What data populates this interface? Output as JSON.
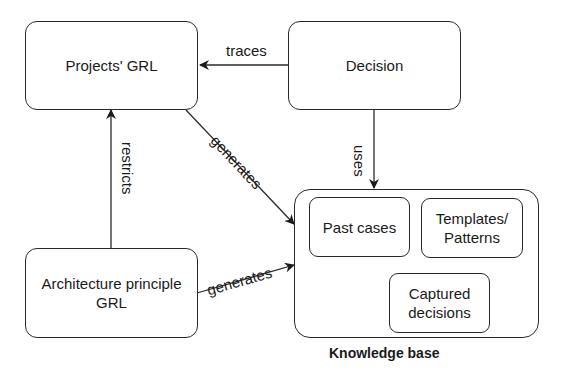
{
  "diagram": {
    "nodes": {
      "projects_grl": "Projects' GRL",
      "decision": "Decision",
      "architecture_principle_grl": "Architecture principle GRL",
      "knowledge_base": "Knowledge base",
      "past_cases": "Past cases",
      "templates_patterns": "Templates/ Patterns",
      "captured_decisions": "Captured decisions"
    },
    "edges": {
      "traces": "traces",
      "uses": "uses",
      "restricts": "restricts",
      "generates_projects": "generates",
      "generates_architecture": "generates"
    },
    "edge_list": [
      {
        "from": "Decision",
        "to": "Projects' GRL",
        "label": "traces"
      },
      {
        "from": "Decision",
        "to": "Knowledge base",
        "label": "uses"
      },
      {
        "from": "Architecture principle GRL",
        "to": "Projects' GRL",
        "label": "restricts"
      },
      {
        "from": "Projects' GRL",
        "to": "Knowledge base",
        "label": "generates"
      },
      {
        "from": "Architecture principle GRL",
        "to": "Knowledge base",
        "label": "generates"
      }
    ],
    "colors": {
      "stroke": "#2a2a2a",
      "background": "#ffffff"
    }
  }
}
